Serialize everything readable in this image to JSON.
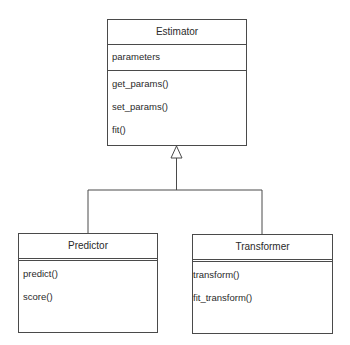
{
  "diagram": {
    "type": "UML class diagram",
    "classes": [
      {
        "name": "Estimator",
        "attributes": [
          "parameters"
        ],
        "methods": [
          "get_params()",
          "set_params()",
          "fit()"
        ]
      },
      {
        "name": "Predictor",
        "attributes": [],
        "methods": [
          "predict()",
          "score()"
        ]
      },
      {
        "name": "Transformer",
        "attributes": [],
        "methods": [
          "transform()",
          "fit_transform()"
        ]
      }
    ],
    "relationships": [
      {
        "type": "generalization",
        "from": "Predictor",
        "to": "Estimator"
      },
      {
        "type": "generalization",
        "from": "Transformer",
        "to": "Estimator"
      }
    ],
    "colors": {
      "stroke": "#4a4a4a",
      "text": "#2a2a2a",
      "background": "#ffffff"
    }
  }
}
